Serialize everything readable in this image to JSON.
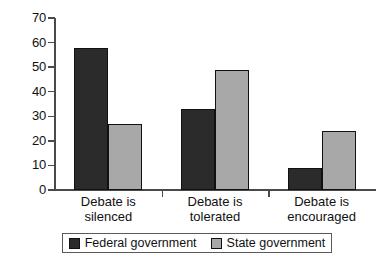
{
  "chart_data": {
    "type": "bar",
    "title": "",
    "subtitle": "",
    "xlabel": "",
    "ylabel": "",
    "ylim": [
      0,
      70
    ],
    "yticks": [
      0,
      10,
      20,
      30,
      40,
      50,
      60,
      70
    ],
    "grid": false,
    "legend_position": "bottom",
    "categories": [
      "Debate is silenced",
      "Debate is tolerated",
      "Debate is encouraged"
    ],
    "category_lines": [
      [
        "Debate is",
        "silenced"
      ],
      [
        "Debate is",
        "tolerated"
      ],
      [
        "Debate is",
        "encouraged"
      ]
    ],
    "series": [
      {
        "name": "Federal government",
        "color": "#2b2b2b",
        "values": [
          58,
          33,
          9
        ]
      },
      {
        "name": "State government",
        "color": "#a8a8a8",
        "values": [
          27,
          49,
          24
        ]
      }
    ]
  },
  "legend": {
    "entries": [
      {
        "label": "Federal government",
        "color": "#2b2b2b"
      },
      {
        "label": "State government",
        "color": "#a8a8a8"
      }
    ]
  },
  "axis": {
    "line_color": "#4a4a4a",
    "tick_color": "#4a4a4a"
  }
}
